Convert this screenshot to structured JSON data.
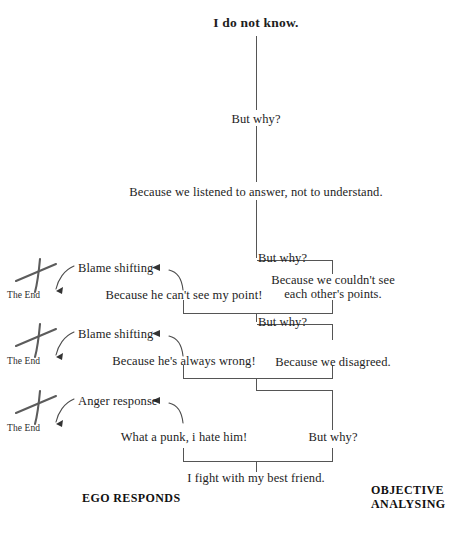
{
  "diagram": {
    "kind": "five-whys-flowchart",
    "title_node": "I do not know.",
    "spine": {
      "why_1": "But why?",
      "answer_1": "Because we listened to answer, not to understand.",
      "why_2": "But why?",
      "answer_2_line1": "Because we couldn't see",
      "answer_2_line2": "each other's points.",
      "why_3": "But why?",
      "answer_3": "Because we disagreed.",
      "why_4": "But why?",
      "answer_4": "I fight with my best friend."
    },
    "ego_branches": [
      {
        "label": "Blame shifting",
        "statement": "Because he can't see my point!",
        "end_label": "The End"
      },
      {
        "label": "Blame shifting",
        "statement": "Because he's always wrong!",
        "end_label": "The End"
      },
      {
        "label": "Anger response",
        "statement": "What a punk, i hate him!",
        "end_label": "The End"
      }
    ],
    "footers": {
      "left": "EGO RESPONDS",
      "right_line1": "OBJECTIVE",
      "right_line2": "ANALYSING"
    },
    "icons": {
      "cross": "x-cross-icon",
      "arrow": "arrowhead-left-icon"
    },
    "colors": {
      "ink": "#1d1d1d",
      "line": "#4a4a4a",
      "sketch": "#5a5a5a",
      "background": "#ffffff"
    }
  }
}
